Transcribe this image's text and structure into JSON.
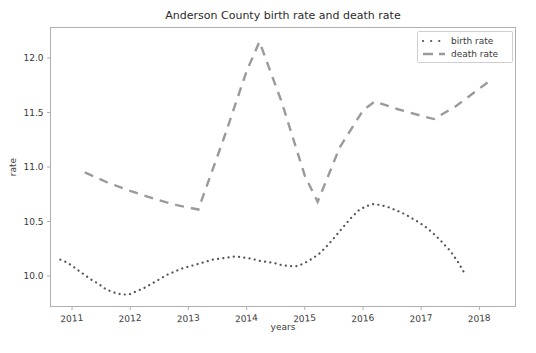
{
  "chart_data": {
    "type": "line",
    "title": "Anderson County birth rate and death rate",
    "xlabel": "years",
    "ylabel": "rate",
    "xlim": [
      2010.63,
      2018.62
    ],
    "ylim": [
      9.72,
      12.28
    ],
    "xticks": [
      "2011",
      "2012",
      "2013",
      "2014",
      "2015",
      "2016",
      "2017",
      "2018"
    ],
    "xtick_values": [
      2011,
      2012,
      2013,
      2014,
      2015,
      2016,
      2017,
      2018
    ],
    "yticks": [
      "10.0",
      "10.5",
      "11.0",
      "11.5",
      "12.0"
    ],
    "ytick_values": [
      10.0,
      10.5,
      11.0,
      11.5,
      12.0
    ],
    "grid": false,
    "legend_position": "upper right",
    "series": [
      {
        "name": "birth rate",
        "style": "dotted",
        "color": "#55555c",
        "x": [
          2010.8,
          2010.93,
          2011.06,
          2011.19,
          2011.32,
          2011.45,
          2011.58,
          2011.71,
          2011.85,
          2011.98,
          2012.11,
          2012.24,
          2012.37,
          2012.5,
          2012.63,
          2012.76,
          2012.9,
          2013.03,
          2013.16,
          2013.29,
          2013.42,
          2013.55,
          2013.68,
          2013.82,
          2013.95,
          2014.08,
          2014.21,
          2014.34,
          2014.47,
          2014.6,
          2014.74,
          2014.87,
          2015.0,
          2015.13,
          2015.26,
          2015.39,
          2015.52,
          2015.66,
          2015.79,
          2015.92,
          2016.05,
          2016.18,
          2016.31,
          2016.44,
          2016.58,
          2016.71,
          2016.84,
          2016.97,
          2017.1,
          2017.23,
          2017.36,
          2017.5,
          2017.63,
          2017.76
        ],
        "y": [
          10.15,
          10.12,
          10.07,
          10.02,
          9.97,
          9.93,
          9.88,
          9.85,
          9.83,
          9.83,
          9.86,
          9.89,
          9.93,
          9.97,
          10.01,
          10.04,
          10.07,
          10.09,
          10.11,
          10.13,
          10.15,
          10.16,
          10.17,
          10.18,
          10.17,
          10.16,
          10.14,
          10.13,
          10.12,
          10.1,
          10.09,
          10.09,
          10.12,
          10.16,
          10.21,
          10.28,
          10.36,
          10.45,
          10.53,
          10.6,
          10.64,
          10.66,
          10.65,
          10.63,
          10.6,
          10.57,
          10.53,
          10.49,
          10.44,
          10.38,
          10.31,
          10.23,
          10.13,
          10.01
        ]
      },
      {
        "name": "death rate",
        "style": "dashed",
        "color": "#9a9a9a",
        "x": [
          2011.22,
          2011.6,
          2012.0,
          2012.4,
          2012.8,
          2013.17,
          2013.6,
          2014.0,
          2014.22,
          2014.6,
          2015.0,
          2015.22,
          2015.6,
          2016.0,
          2016.2,
          2016.6,
          2017.0,
          2017.22,
          2017.6,
          2018.2
        ],
        "y": [
          10.95,
          10.86,
          10.78,
          10.71,
          10.65,
          10.61,
          11.25,
          11.88,
          12.15,
          11.6,
          10.92,
          10.68,
          11.18,
          11.52,
          11.6,
          11.53,
          11.47,
          11.44,
          11.56,
          11.8
        ]
      }
    ]
  },
  "legend": {
    "entries": [
      {
        "label": "birth rate",
        "marker": "dotted-line"
      },
      {
        "label": "death rate",
        "marker": "dashed-line"
      }
    ]
  }
}
